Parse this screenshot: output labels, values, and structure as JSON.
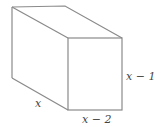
{
  "figure": {
    "type": "rectangular-prism",
    "labels": {
      "depth": "x",
      "width": "x − 2",
      "height": "x − 1"
    },
    "stroke_color": "#8a8a8a",
    "background": "#ffffff"
  }
}
